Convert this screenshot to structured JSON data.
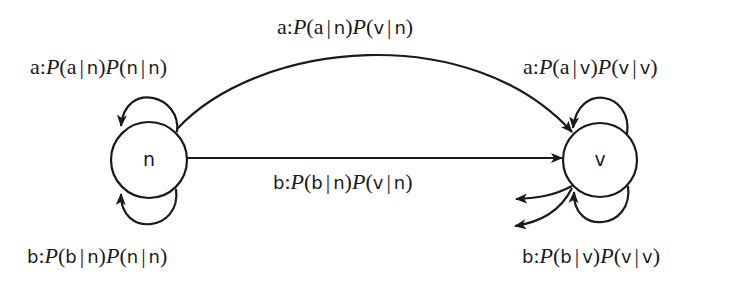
{
  "diagram": {
    "type": "state-transition",
    "nodes": [
      {
        "id": "n",
        "label": "n",
        "cx": 149,
        "cy": 160,
        "r": 38
      },
      {
        "id": "v",
        "label": "v",
        "cx": 600,
        "cy": 160,
        "r": 37
      }
    ],
    "edges": [
      {
        "id": "n_to_n_a",
        "from": "n",
        "to": "n",
        "kind": "self-loop-top",
        "label": {
          "emit": "a",
          "sep": ":",
          "p1": {
            "x": "a",
            "given": "n"
          },
          "p2": {
            "x": "n",
            "given": "n"
          }
        }
      },
      {
        "id": "n_to_n_b",
        "from": "n",
        "to": "n",
        "kind": "self-loop-bottom",
        "label": {
          "emit": "b",
          "sep": ":",
          "p1": {
            "x": "b",
            "given": "n"
          },
          "p2": {
            "x": "n",
            "given": "n"
          }
        }
      },
      {
        "id": "n_to_v_a",
        "from": "n",
        "to": "v",
        "kind": "curved-arc",
        "label": {
          "emit": "a",
          "sep": ":",
          "p1": {
            "x": "a",
            "given": "n"
          },
          "p2": {
            "x": "v",
            "given": "n"
          }
        }
      },
      {
        "id": "n_to_v_b",
        "from": "n",
        "to": "v",
        "kind": "straight",
        "label": {
          "emit": "b",
          "sep": ":",
          "p1": {
            "x": "b",
            "given": "n"
          },
          "p2": {
            "x": "v",
            "given": "n"
          }
        }
      },
      {
        "id": "v_to_v_a",
        "from": "v",
        "to": "v",
        "kind": "self-loop-top",
        "label": {
          "emit": "a",
          "sep": ":",
          "p1": {
            "x": "a",
            "given": "v"
          },
          "p2": {
            "x": "v",
            "given": "v"
          }
        }
      },
      {
        "id": "v_to_v_b",
        "from": "v",
        "to": "v",
        "kind": "self-loop-bottom",
        "label": {
          "emit": "b",
          "sep": ":",
          "p1": {
            "x": "b",
            "given": "v"
          },
          "p2": {
            "x": "v",
            "given": "v"
          }
        }
      },
      {
        "id": "v_out_1",
        "from": "v",
        "to": null,
        "kind": "outgoing-stub",
        "label": null
      },
      {
        "id": "v_out_2",
        "from": "v",
        "to": null,
        "kind": "outgoing-stub",
        "label": null
      }
    ],
    "prob_symbol": "P",
    "bar_symbol": "|",
    "open_paren": "(",
    "close_paren": ")",
    "stroke_color": "#1a1a1a",
    "background_color": "#ffffff"
  }
}
